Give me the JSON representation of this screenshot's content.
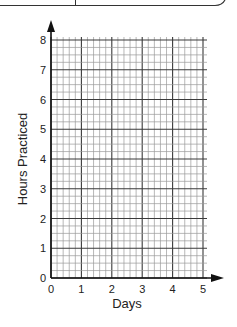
{
  "chart_data": {
    "type": "line",
    "title": "",
    "xlabel": "Days",
    "ylabel": "Hours Practiced",
    "x_ticks": [
      "0",
      "1",
      "2",
      "3",
      "4",
      "5"
    ],
    "y_ticks": [
      "0",
      "1",
      "2",
      "3",
      "4",
      "5",
      "6",
      "7",
      "8"
    ],
    "xlim": [
      0,
      5
    ],
    "ylim": [
      0,
      8
    ],
    "grid": true,
    "x_minor_per_unit": 5,
    "y_minor_per_unit": 4,
    "series": []
  },
  "colors": {
    "grid_minor": "#9a9a9a",
    "grid_major": "#3a3a3a",
    "axis": "#111111"
  }
}
